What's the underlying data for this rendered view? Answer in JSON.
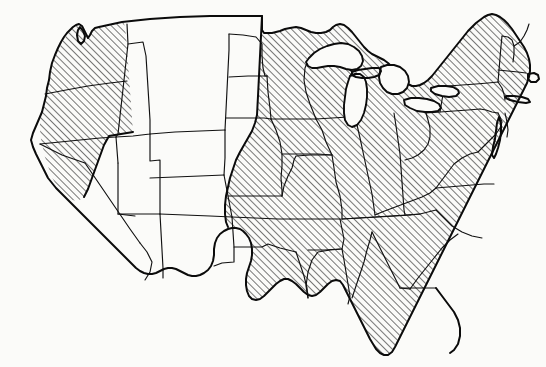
{
  "figure": {
    "kind": "thematic-map",
    "title": "",
    "caption": "",
    "background_color": "#fbfbf9",
    "line_color": "#0b0b0b",
    "state_line_color": "#111111",
    "hatch": {
      "style": "diagonal-lines",
      "angle_degrees": 45,
      "direction": "lower-left to upper-right",
      "spacing_px": 5,
      "line_width_px": 1,
      "color": "#141414",
      "meaning": ""
    },
    "legend": {
      "present": false,
      "entries": []
    },
    "labels": {
      "present": false,
      "items": []
    }
  },
  "map": {
    "projection_hint": "conic",
    "viewbox": "0 0 546 367",
    "extent_px": {
      "left": 30,
      "top": 14,
      "right": 537,
      "bottom": 356
    },
    "great_lakes": {
      "filled": false,
      "names": [
        "Lake Superior",
        "Lake Michigan",
        "Lake Huron",
        "Lake Erie",
        "Lake Ontario"
      ]
    },
    "hatched_regions": [
      {
        "name": "pacific-northwest",
        "states": [
          "Washington",
          "Oregon",
          "Idaho",
          "Northern California"
        ]
      },
      {
        "name": "eastern-humid",
        "states": [
          "North Dakota (east)",
          "South Dakota (east)",
          "Nebraska (east)",
          "Kansas (east)",
          "Oklahoma (east)",
          "Texas (east)",
          "Minnesota",
          "Iowa",
          "Missouri",
          "Arkansas",
          "Louisiana",
          "Wisconsin",
          "Illinois",
          "Michigan",
          "Indiana",
          "Ohio",
          "Kentucky",
          "Tennessee",
          "Mississippi",
          "Alabama",
          "Georgia",
          "Florida",
          "South Carolina",
          "North Carolina",
          "Virginia",
          "West Virginia",
          "Maryland",
          "Delaware",
          "Pennsylvania",
          "New Jersey",
          "New York",
          "Connecticut",
          "Rhode Island",
          "Massachusetts",
          "Vermont",
          "New Hampshire",
          "Maine"
        ]
      }
    ],
    "unhatched_regions": [
      {
        "name": "arid-west",
        "states": [
          "Montana",
          "Wyoming",
          "Colorado",
          "Utah",
          "Nevada",
          "Arizona",
          "New Mexico",
          "Southern California",
          "North Dakota (west)",
          "South Dakota (west)",
          "Nebraska (west)",
          "Kansas (west)",
          "Oklahoma (panhandle)",
          "Texas (west)"
        ]
      }
    ]
  }
}
